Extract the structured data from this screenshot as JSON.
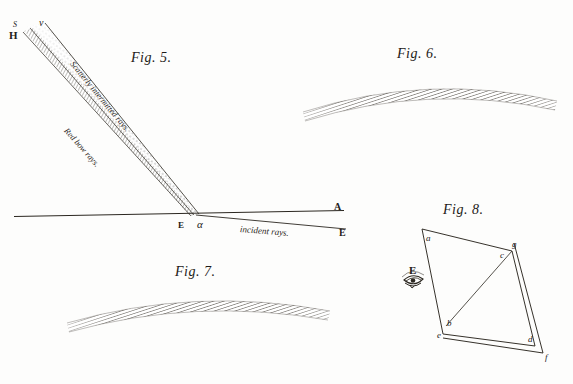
{
  "plate": {
    "title": "Optical plate: rainbow ray diagrams",
    "background_color": "#fdfdfc",
    "ink_color": "#232019"
  },
  "figures": [
    {
      "id": "fig5",
      "caption": "Fig. 5.",
      "description": "Band of rays from H v descending to vertex alpha on horizon line with incident rays",
      "labels": [
        {
          "name": "point-S",
          "text": "S",
          "style": "italic"
        },
        {
          "name": "point-H",
          "text": "H",
          "style": "capital"
        },
        {
          "name": "point-v",
          "text": "v",
          "style": "italic"
        },
        {
          "name": "point-E-vertex",
          "text": "E",
          "style": "capital"
        },
        {
          "name": "point-alpha",
          "text": "α",
          "style": "italic"
        },
        {
          "name": "point-A",
          "text": "A",
          "style": "capital"
        },
        {
          "name": "point-B",
          "text": "E",
          "style": "capital"
        }
      ],
      "annotations": [
        {
          "name": "scattered-rays-label",
          "text": "Scatterly intermitted rays."
        },
        {
          "name": "red-bow-rays-label",
          "text": "Red bow rays."
        },
        {
          "name": "incident-rays-label",
          "text": "incident rays."
        }
      ]
    },
    {
      "id": "fig6",
      "caption": "Fig. 6.",
      "description": "Shaded curved arc band, rainbow bow, hatched engraving"
    },
    {
      "id": "fig7",
      "caption": "Fig. 7.",
      "description": "Shaded curved arc band, rainbow bow, hatched engraving"
    },
    {
      "id": "fig8",
      "caption": "Fig. 8.",
      "description": "Quadrilateral a c d e with diagonal b to c, doubled edges, observer eye at E",
      "labels": [
        {
          "name": "vertex-a",
          "text": "a",
          "style": "italic"
        },
        {
          "name": "vertex-g",
          "text": "g",
          "style": "italic"
        },
        {
          "name": "vertex-c",
          "text": "c",
          "style": "italic"
        },
        {
          "name": "vertex-b",
          "text": "b",
          "style": "italic"
        },
        {
          "name": "vertex-e",
          "text": "e",
          "style": "italic"
        },
        {
          "name": "vertex-d",
          "text": "d",
          "style": "italic"
        },
        {
          "name": "vertex-f",
          "text": "f",
          "style": "italic"
        },
        {
          "name": "observer-E",
          "text": "E",
          "style": "capital"
        }
      ],
      "eye_icon": "eye-icon"
    }
  ]
}
